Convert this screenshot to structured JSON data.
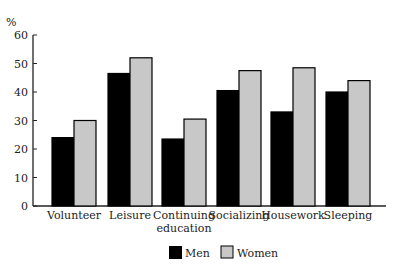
{
  "chart_data": {
    "type": "bar",
    "title": "",
    "xlabel": "",
    "ylabel": "%",
    "ylim": [
      0,
      60
    ],
    "yticks": [
      0,
      10,
      20,
      30,
      40,
      50,
      60
    ],
    "grid": false,
    "legend_position": "bottom-center",
    "categories": [
      "Volunteer",
      "Leisure",
      "Continuing education",
      "Socializing",
      "Housework",
      "Sleeping"
    ],
    "category_lines": [
      [
        "Volunteer"
      ],
      [
        "Leisure"
      ],
      [
        "Continuing",
        "education"
      ],
      [
        "Socializing"
      ],
      [
        "Housework"
      ],
      [
        "Sleeping"
      ]
    ],
    "series": [
      {
        "name": "Men",
        "color": "#000000",
        "values": [
          24,
          46.5,
          23.5,
          40.5,
          33,
          40
        ]
      },
      {
        "name": "Women",
        "color": "#c8c8c8",
        "values": [
          30,
          52,
          30.5,
          47.5,
          48.5,
          44
        ]
      }
    ]
  },
  "legend": {
    "men": "Men",
    "women": "Women"
  },
  "axis": {
    "ylabel": "%"
  }
}
